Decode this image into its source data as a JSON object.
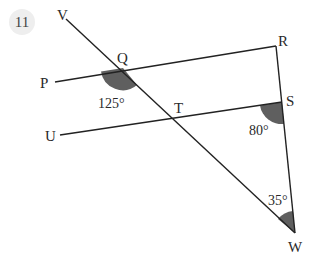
{
  "question_number": "11",
  "colors": {
    "line": "#222222",
    "angle_fill": "#5f5f5f",
    "badge_bg": "#eeeeee"
  },
  "points": {
    "V": {
      "label": "V"
    },
    "Q": {
      "label": "Q"
    },
    "R": {
      "label": "R"
    },
    "P": {
      "label": "P"
    },
    "T": {
      "label": "T"
    },
    "S": {
      "label": "S"
    },
    "U": {
      "label": "U"
    },
    "W": {
      "label": "W"
    }
  },
  "angles": {
    "PQT": {
      "label": "125°",
      "value": 125
    },
    "TSW": {
      "label": "80°",
      "value": 80
    },
    "SWT": {
      "label": "35°",
      "value": 35
    }
  },
  "lines": [
    {
      "from": "P",
      "to": "R",
      "via": "Q"
    },
    {
      "from": "U",
      "to": "S",
      "via": "T"
    },
    {
      "from": "V",
      "to": "W",
      "via": [
        "Q",
        "T"
      ]
    },
    {
      "from": "R",
      "to": "W",
      "via": "S"
    }
  ]
}
